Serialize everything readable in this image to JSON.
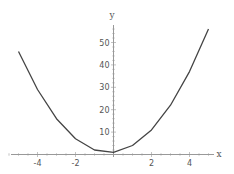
{
  "chart_data": {
    "type": "line",
    "title": "",
    "xlabel": "x",
    "ylabel": "y",
    "x": [
      -5,
      -4,
      -3,
      -2,
      -1,
      0,
      1,
      2,
      3,
      4,
      5
    ],
    "series": [
      {
        "name": "y",
        "values": [
          46,
          29,
          16,
          7,
          2,
          1,
          4,
          11,
          22,
          37,
          56
        ]
      }
    ],
    "xlim": [
      -5.5,
      5.3
    ],
    "ylim": [
      0,
      57
    ],
    "x_ticks": [
      -4,
      -2,
      2,
      4
    ],
    "x_tick_labels": [
      "-4",
      "-2",
      "2",
      "4"
    ],
    "y_ticks": [
      10,
      20,
      30,
      40,
      50
    ],
    "y_tick_labels": [
      "10",
      "20",
      "30",
      "40",
      "50"
    ],
    "grid": false,
    "legend": "none",
    "colors": {
      "line": "#444444",
      "axis": "#999999",
      "text": "#555555"
    }
  }
}
